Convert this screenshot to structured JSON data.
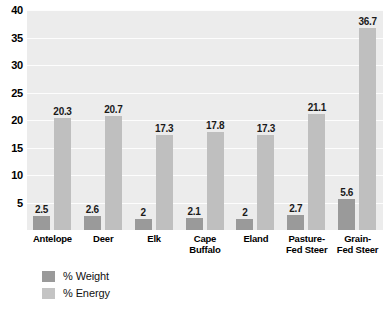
{
  "chart_data": {
    "type": "bar",
    "title": "",
    "xlabel": "",
    "ylabel": "",
    "ylim": [
      0,
      40
    ],
    "grid": true,
    "legend_position": "bottom-left",
    "categories": [
      "Antelope",
      "Deer",
      "Elk",
      "Cape Buffalo",
      "Eland",
      "Pasture-Fed Steer",
      "Grain-Fed Steer"
    ],
    "category_lines": [
      [
        "Antelope"
      ],
      [
        "Deer"
      ],
      [
        "Elk"
      ],
      [
        "Cape",
        "Buffalo"
      ],
      [
        "Eland"
      ],
      [
        "Pasture-",
        "Fed Steer"
      ],
      [
        "Grain-",
        "Fed Steer"
      ]
    ],
    "series": [
      {
        "name": "% Weight",
        "color": "#9a9a9a",
        "values": [
          2.5,
          2.6,
          2,
          2.1,
          2,
          2.7,
          5.6
        ],
        "labels": [
          "2.5",
          "2.6",
          "2",
          "2.1",
          "2",
          "2.7",
          "5.6"
        ]
      },
      {
        "name": "% Energy",
        "color": "#bfbfbf",
        "values": [
          20.3,
          20.7,
          17.3,
          17.8,
          17.3,
          21.1,
          36.7
        ],
        "labels": [
          "20.3",
          "20.7",
          "17.3",
          "17.8",
          "17.3",
          "21.1",
          "36.7"
        ]
      }
    ],
    "y_ticks": [
      5,
      10,
      15,
      20,
      25,
      30,
      35,
      40
    ],
    "y_tick_labels": [
      "5",
      "10",
      "15",
      "20",
      "25",
      "30",
      "35",
      "40"
    ],
    "plot_background": "#ececec",
    "gridline_color": "#fdfdfd"
  },
  "legend": {
    "items": [
      {
        "label": "% Weight"
      },
      {
        "label": "% Energy"
      }
    ]
  }
}
